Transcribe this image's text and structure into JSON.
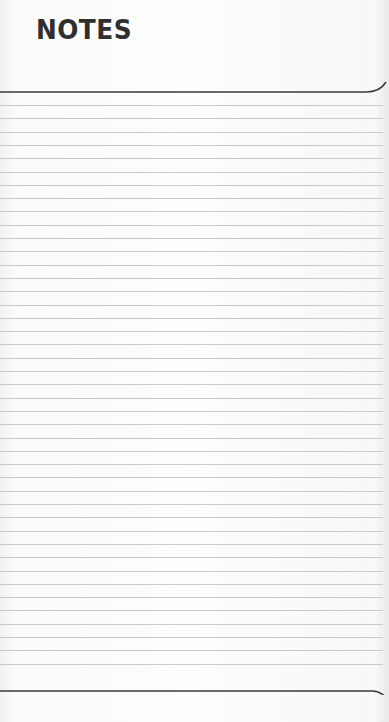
{
  "header": {
    "title": "NOTES"
  },
  "ruling": {
    "top_rule_y": 92,
    "bottom_rule_y": 691,
    "first_line_y": 105,
    "line_spacing": 13.3,
    "line_count": 43,
    "line_color": "#c9c9c9",
    "rule_color": "#3a3a3a"
  }
}
